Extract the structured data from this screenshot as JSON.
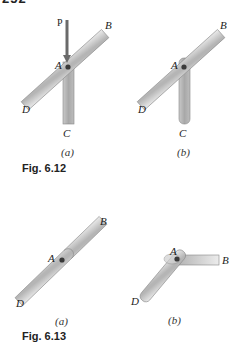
{
  "page": {
    "number": "252"
  },
  "figures": [
    {
      "caption": "Fig. 6.12",
      "panels": [
        {
          "sublabel": "(a)",
          "labels": {
            "P": "P",
            "A": "A",
            "B": "B",
            "C": "C",
            "D": "D"
          }
        },
        {
          "sublabel": "(b)",
          "labels": {
            "A": "A",
            "B": "B",
            "C": "C",
            "D": "D"
          }
        }
      ]
    },
    {
      "caption": "Fig. 6.13",
      "panels": [
        {
          "sublabel": "(a)",
          "labels": {
            "A": "A",
            "B": "B",
            "D": "D"
          }
        },
        {
          "sublabel": "(b)",
          "labels": {
            "A": "A",
            "B": "B",
            "D": "D"
          }
        }
      ]
    }
  ],
  "colors": {
    "bar_light": "#e4e4e4",
    "bar_dark": "#a9a9a9",
    "outline": "#7a7a7a",
    "arrow": "#6a6a6a",
    "pin": "#3a3a3a"
  }
}
